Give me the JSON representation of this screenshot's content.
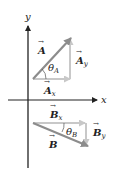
{
  "diagram": {
    "axes": {
      "x_label": "x",
      "y_label": "y",
      "axis_color": "#222222"
    },
    "vector_A": {
      "label": "A",
      "component_x_label": "A",
      "component_x_sub": "x",
      "component_y_label": "A",
      "component_y_sub": "y",
      "angle_label": "θ",
      "angle_sub": "A",
      "vector_color": "#8c8c8c",
      "component_color": "#c8c8c8"
    },
    "vector_B": {
      "label": "B",
      "component_x_label": "B",
      "component_x_sub": "x",
      "component_y_label": "B",
      "component_y_sub": "y",
      "angle_label": "θ",
      "angle_sub": "B",
      "vector_color": "#8c8c8c",
      "component_color": "#c8c8c8"
    }
  }
}
